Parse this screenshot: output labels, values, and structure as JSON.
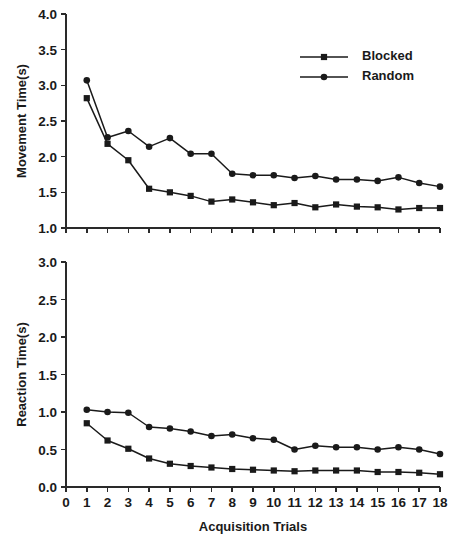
{
  "figure": {
    "background": "#ffffff",
    "ink_color": "#1a1a1a",
    "xlabel": "Acquisition Trials",
    "legend": {
      "position": "top-right-panel-1",
      "entries": [
        {
          "label": "Blocked",
          "marker": "square"
        },
        {
          "label": "Random",
          "marker": "circle"
        }
      ]
    }
  },
  "chart_data": [
    {
      "type": "line",
      "panel": "top",
      "title": "",
      "xlabel": "Acquisition Trials",
      "ylabel": "Movement Time(s)",
      "xlim": [
        0,
        18
      ],
      "ylim": [
        1.0,
        4.0
      ],
      "grid": false,
      "xticks": [
        0,
        1,
        2,
        3,
        4,
        5,
        6,
        7,
        8,
        9,
        10,
        11,
        12,
        13,
        14,
        15,
        16,
        17,
        18
      ],
      "xticklabels": [
        "",
        "",
        "",
        "",
        "",
        "",
        "",
        "",
        "",
        "",
        "",
        "",
        "",
        "",
        "",
        "",
        "",
        "",
        ""
      ],
      "yticks": [
        1.0,
        1.5,
        2.0,
        2.5,
        3.0,
        3.5,
        4.0
      ],
      "yticklabels": [
        "1.0",
        "1.5",
        "2.0",
        "2.5",
        "3.0",
        "3.5",
        "4.0"
      ],
      "x": [
        1,
        2,
        3,
        4,
        5,
        6,
        7,
        8,
        9,
        10,
        11,
        12,
        13,
        14,
        15,
        16,
        17,
        18
      ],
      "series": [
        {
          "name": "Blocked",
          "marker": "square",
          "values": [
            2.82,
            2.18,
            1.95,
            1.55,
            1.5,
            1.45,
            1.37,
            1.4,
            1.36,
            1.32,
            1.35,
            1.29,
            1.33,
            1.3,
            1.29,
            1.26,
            1.28,
            1.28
          ]
        },
        {
          "name": "Random",
          "marker": "circle",
          "values": [
            3.07,
            2.27,
            2.36,
            2.14,
            2.26,
            2.04,
            2.04,
            1.76,
            1.74,
            1.74,
            1.7,
            1.73,
            1.68,
            1.68,
            1.66,
            1.71,
            1.63,
            1.58
          ]
        }
      ]
    },
    {
      "type": "line",
      "panel": "bottom",
      "title": "",
      "xlabel": "Acquisition Trials",
      "ylabel": "Reaction Time(s)",
      "xlim": [
        0,
        18
      ],
      "ylim": [
        0.0,
        3.0
      ],
      "grid": false,
      "xticks": [
        0,
        1,
        2,
        3,
        4,
        5,
        6,
        7,
        8,
        9,
        10,
        11,
        12,
        13,
        14,
        15,
        16,
        17,
        18
      ],
      "xticklabels": [
        "0",
        "1",
        "2",
        "3",
        "4",
        "5",
        "6",
        "7",
        "8",
        "9",
        "10",
        "11",
        "12",
        "13",
        "14",
        "15",
        "16",
        "17",
        "18"
      ],
      "yticks": [
        0.0,
        0.5,
        1.0,
        1.5,
        2.0,
        2.5,
        3.0
      ],
      "yticklabels": [
        "0.0",
        "0.5",
        "1.0",
        "1.5",
        "2.0",
        "2.5",
        "3.0"
      ],
      "x": [
        1,
        2,
        3,
        4,
        5,
        6,
        7,
        8,
        9,
        10,
        11,
        12,
        13,
        14,
        15,
        16,
        17,
        18
      ],
      "series": [
        {
          "name": "Blocked",
          "marker": "square",
          "values": [
            0.85,
            0.62,
            0.51,
            0.38,
            0.31,
            0.28,
            0.26,
            0.24,
            0.23,
            0.22,
            0.21,
            0.22,
            0.22,
            0.22,
            0.2,
            0.2,
            0.19,
            0.17
          ]
        },
        {
          "name": "Random",
          "marker": "circle",
          "values": [
            1.03,
            1.0,
            0.99,
            0.8,
            0.78,
            0.74,
            0.68,
            0.7,
            0.65,
            0.63,
            0.5,
            0.55,
            0.53,
            0.53,
            0.5,
            0.53,
            0.5,
            0.44
          ]
        }
      ]
    }
  ]
}
